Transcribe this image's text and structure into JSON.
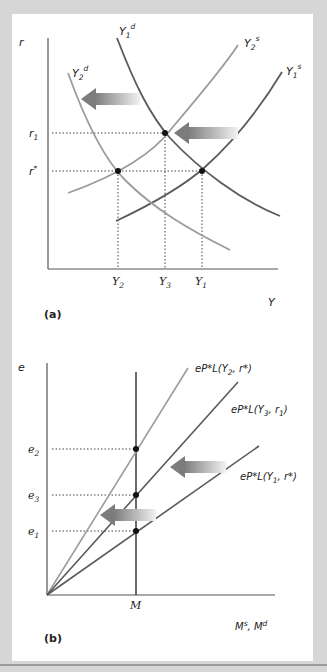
{
  "colors": {
    "background": "#d6d6d6",
    "panel": "#ffffff",
    "dark_curve": "#5a5a5a",
    "light_curve": "#9c9c9c",
    "axis": "#555555",
    "arrow": "#8c8c8c"
  },
  "panel_a": {
    "caption": "(a)",
    "y_axis_label": "r",
    "x_axis_label": "Y",
    "y_ticks": [
      {
        "base": "r",
        "sub": "1"
      },
      {
        "base": "r",
        "sup": "*"
      }
    ],
    "x_ticks": [
      {
        "base": "Y",
        "sub": "2"
      },
      {
        "base": "Y",
        "sub": "3"
      },
      {
        "base": "Y",
        "sub": "1"
      }
    ],
    "curves": [
      {
        "name": "Y1d",
        "base": "Y",
        "sub": "1",
        "sup": "d"
      },
      {
        "name": "Y2s",
        "base": "Y",
        "sub": "2",
        "sup": "s"
      },
      {
        "name": "Y2d",
        "base": "Y",
        "sub": "2",
        "sup": "d"
      },
      {
        "name": "Y1s",
        "base": "Y",
        "sub": "1",
        "sup": "s"
      }
    ]
  },
  "panel_b": {
    "caption": "(b)",
    "y_axis_label": "e",
    "x_axis_label": "Ms, Md",
    "x_axis_parts": {
      "a": "M",
      "a_sup": "s",
      "sep": ", ",
      "b": "M",
      "b_sup": "d"
    },
    "y_ticks": [
      {
        "base": "e",
        "sub": "2"
      },
      {
        "base": "e",
        "sub": "3"
      },
      {
        "base": "e",
        "sub": "1"
      }
    ],
    "x_tick": "M",
    "lines": [
      {
        "name": "L_Y2_rstar",
        "prefix": "eP*L(Y",
        "sub": "2",
        "suffix": ", r*)"
      },
      {
        "name": "L_Y3_r1",
        "prefix": "eP*L(Y",
        "sub": "3",
        "suffix": ", r",
        "sub2": "1",
        "end": ")"
      },
      {
        "name": "L_Y1_rstar",
        "prefix": "eP*L(Y",
        "sub": "1",
        "suffix": ", r*)"
      }
    ]
  }
}
